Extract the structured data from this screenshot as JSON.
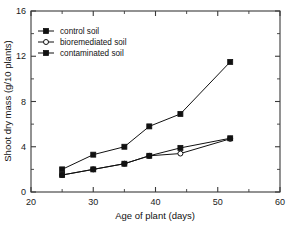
{
  "chart_data": {
    "type": "line",
    "title": "",
    "xlabel": "Age of plant (days)",
    "ylabel": "Shoot dry mass (g/10 plants)",
    "xlim": [
      20,
      60
    ],
    "ylim": [
      0,
      16
    ],
    "xticks": [
      20,
      30,
      40,
      50,
      60
    ],
    "yticks": [
      0,
      4,
      8,
      12,
      16
    ],
    "xminor_ticks": [
      25,
      35,
      45,
      55
    ],
    "yminor_ticks": [
      2,
      6,
      10,
      14
    ],
    "grid": false,
    "legend_position": "top-left",
    "series": [
      {
        "name": "control soil",
        "marker": "filled-square",
        "x": [
          25,
          30,
          35,
          39,
          44,
          52
        ],
        "values": [
          2.0,
          3.3,
          4.0,
          5.8,
          6.9,
          11.5
        ]
      },
      {
        "name": "bioremediated soil",
        "marker": "open-circle",
        "x": [
          25,
          30,
          35,
          39,
          44,
          52
        ],
        "values": [
          1.5,
          2.0,
          2.5,
          3.2,
          3.4,
          4.7
        ]
      },
      {
        "name": "contaminated soil",
        "marker": "filled-square",
        "x": [
          25,
          30,
          35,
          39,
          44,
          52
        ],
        "values": [
          1.5,
          2.0,
          2.5,
          3.2,
          3.9,
          4.75
        ]
      }
    ]
  },
  "axis": {
    "x_tick_labels": [
      "20",
      "30",
      "40",
      "50",
      "60"
    ],
    "y_tick_labels": [
      "0",
      "4",
      "8",
      "12",
      "16"
    ],
    "x_title": "Age of plant (days)",
    "y_title": "Shoot dry mass (g/10 plants)"
  },
  "legend": {
    "entries": [
      {
        "label": "control soil"
      },
      {
        "label": "bioremediated soil"
      },
      {
        "label": "contaminated soil"
      }
    ]
  },
  "colors": {
    "ink": "#111111",
    "axis": "#3a3a3a",
    "background": "#ffffff"
  }
}
